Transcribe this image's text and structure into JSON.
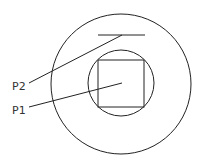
{
  "diagram": {
    "labels": {
      "p1": "P1",
      "p2": "P2"
    },
    "elements": [
      "outer-circle",
      "inner-circle",
      "square",
      "top-line",
      "leader-p1",
      "leader-p2"
    ],
    "stroke_color": "#222222"
  }
}
